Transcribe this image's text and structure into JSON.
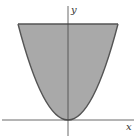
{
  "diagram": {
    "type": "shaded-region-parabola",
    "labels": {
      "x_axis": "x",
      "y_axis": "y"
    },
    "colors": {
      "fill": "#a9a9a9",
      "boundary": "#555555",
      "axis": "#444444",
      "background": "#ffffff"
    },
    "region": {
      "description": "Region bounded below by parabola y = kx^2 and above by a horizontal line",
      "vertex": [
        68,
        120
      ],
      "top_line_y": 24,
      "top_left_x": 18,
      "top_right_x": 118
    }
  }
}
